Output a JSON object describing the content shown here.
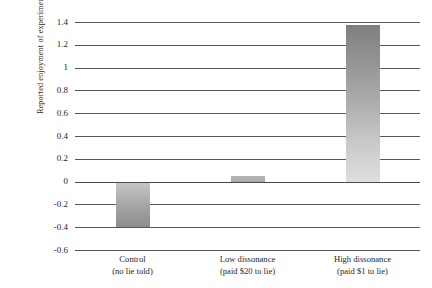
{
  "chart_data": {
    "type": "bar",
    "title": "",
    "subtitle": "",
    "xlabel": "",
    "ylabel": "Reported enjoyment of experiment",
    "categories": [
      "Control\n(no lie told)",
      "Low dissonance\n(paid $20 to lie)",
      "High dissonance\n(paid $1 to lie)"
    ],
    "category_lines": [
      {
        "line1": "Control",
        "line2": "(no lie told)"
      },
      {
        "line1": "Low dissonance",
        "line2": "(paid $20 to lie)"
      },
      {
        "line1": "High dissonance",
        "line2": "(paid $1 to lie)"
      }
    ],
    "values": [
      -0.4,
      0.05,
      1.37
    ],
    "ylim": [
      -0.6,
      1.4
    ],
    "ytick_step": 0.2,
    "ytick_labels": [
      "1.4",
      "1.2",
      "1",
      "0.8",
      "0.6",
      "0.4",
      "0.2",
      "0",
      "-0.2",
      "-0.4",
      "-0.6"
    ],
    "ytick_values": [
      1.4,
      1.2,
      1.0,
      0.8,
      0.6,
      0.4,
      0.2,
      0,
      -0.2,
      -0.4,
      -0.6
    ],
    "grid": true,
    "grid_orientation": "horizontal",
    "legend": false,
    "legend_position": "none",
    "zero_line": 0,
    "bar_fill_style": "vertical-gradient-grayscale",
    "colors": {
      "gridline": "#575757",
      "zero_line": "#4a4a4a",
      "text": "#1f1f1f",
      "background": "#ffffff",
      "bar_control_top": "#c7c7c7",
      "bar_control_bottom": "#8d8d8d",
      "bar_low": "#aeaeae",
      "bar_high_top": "#7e7e7e",
      "bar_high_bottom": "#dedede"
    }
  }
}
